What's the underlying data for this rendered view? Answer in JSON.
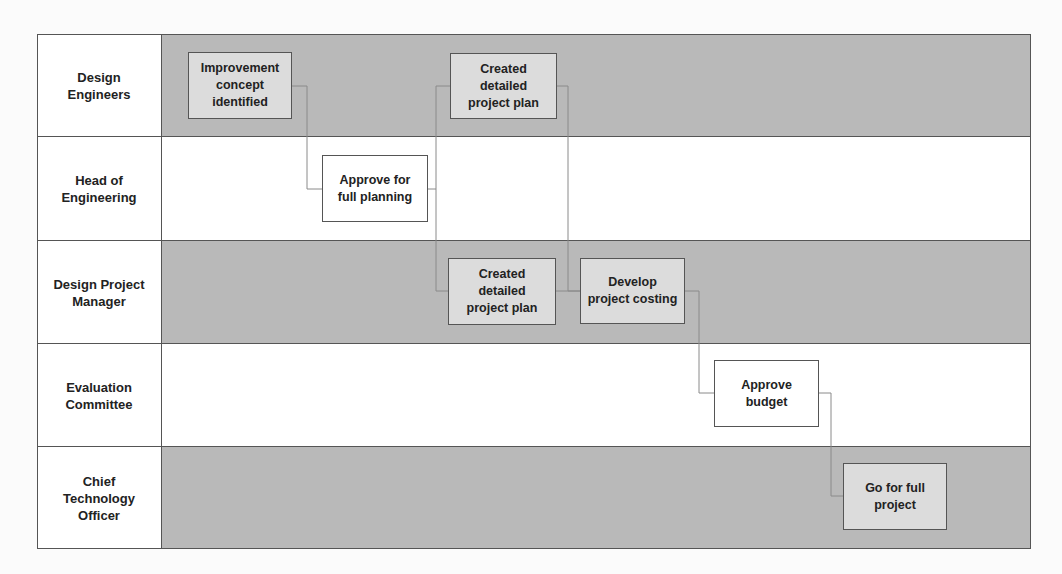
{
  "diagram": {
    "type": "swimlane-flowchart",
    "colors": {
      "shaded_lane": "#b9b9b9",
      "plain_lane": "#ffffff",
      "shaded_box": "#dcdcdc",
      "plain_box": "#ffffff",
      "border": "#555555",
      "connector": "#8a8a8a"
    },
    "lanes": [
      {
        "label": "Design\nEngineers",
        "shaded": true
      },
      {
        "label": "Head of\nEngineering",
        "shaded": false
      },
      {
        "label": "Design Project\nManager",
        "shaded": true
      },
      {
        "label": "Evaluation\nCommittee",
        "shaded": false
      },
      {
        "label": "Chief\nTechnology\nOfficer",
        "shaded": true
      }
    ],
    "nodes": [
      {
        "id": "n1",
        "lane": 0,
        "text": "Improvement\nconcept\nidentified"
      },
      {
        "id": "n2",
        "lane": 1,
        "text": "Approve for\nfull planning"
      },
      {
        "id": "n3",
        "lane": 0,
        "text": "Created\ndetailed\nproject plan"
      },
      {
        "id": "n4",
        "lane": 2,
        "text": "Created\ndetailed\nproject plan"
      },
      {
        "id": "n5",
        "lane": 2,
        "text": "Develop\nproject costing"
      },
      {
        "id": "n6",
        "lane": 3,
        "text": "Approve\nbudget"
      },
      {
        "id": "n7",
        "lane": 4,
        "text": "Go for full\nproject"
      }
    ],
    "edges": [
      {
        "from": "n1",
        "to": "n2"
      },
      {
        "from": "n2",
        "to": "n3"
      },
      {
        "from": "n2",
        "to": "n4"
      },
      {
        "from": "n3",
        "to": "n5"
      },
      {
        "from": "n4",
        "to": "n5"
      },
      {
        "from": "n5",
        "to": "n6"
      },
      {
        "from": "n6",
        "to": "n7"
      }
    ]
  }
}
